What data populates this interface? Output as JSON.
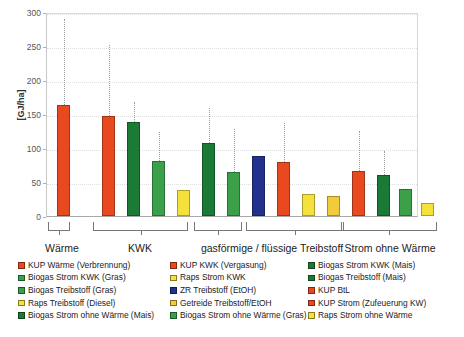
{
  "chart_data": {
    "type": "bar",
    "title": "",
    "xlabel": "",
    "ylabel": "[GJ/ha]",
    "ylim": [
      0,
      300
    ],
    "yticks": [
      0,
      50,
      100,
      150,
      200,
      250,
      300
    ],
    "grid": true,
    "legend_position": "bottom",
    "error_bars": "dotted upper whisker",
    "groups": [
      {
        "label": "Wärme",
        "n_bars": 1
      },
      {
        "label": "KWK",
        "n_bars": 4
      },
      {
        "label": "gasförmige / flüssige Treibstoff",
        "n_bars": 6,
        "sub_brackets": 2
      },
      {
        "label": "Strom ohne Wärme",
        "n_bars": 4
      }
    ],
    "categories": [
      "KUP Wärme (Verbrennung)",
      "KUP KWK (Vergasung)",
      "Biogas Strom KWK (Mais)",
      "Biogas Strom KWK (Gras)",
      "Raps Strom KWK",
      "Biogas Treibstoff (Mais)",
      "Biogas Treibstoff (Gras)",
      "ZR Treibstoff (EtOH)",
      "KUP BtL",
      "Raps Treibstoff (Diesel)",
      "Getreide Treibstoff/EtOH",
      "KUP Strom (Zufeuerung KW)",
      "Biogas Strom ohne Wärme (Mais)",
      "Biogas Strom ohne Wärme (Gras)",
      "Raps Strom ohne Wärme"
    ],
    "values": [
      163,
      147,
      138,
      81,
      38,
      108,
      64,
      88,
      79,
      33,
      30,
      66,
      61,
      39,
      19
    ],
    "error_upper": [
      290,
      251,
      167,
      123,
      null,
      159,
      128,
      null,
      137,
      null,
      null,
      125,
      96,
      null,
      null
    ],
    "colors": [
      "#e8491f",
      "#e8491f",
      "#1b7a36",
      "#3aa14a",
      "#f5e13c",
      "#1b7a36",
      "#3aa14a",
      "#22328c",
      "#e8491f",
      "#f5e13c",
      "#f2cb3a",
      "#e8491f",
      "#1b7a36",
      "#3aa14a",
      "#f5e13c"
    ],
    "bars": [
      {
        "name": "KUP Wärme (Verbrennung)",
        "value": 163,
        "upper": 290,
        "color": "#e8491f",
        "group": "Wärme",
        "x": 56
      },
      {
        "name": "KUP KWK (Vergasung)",
        "value": 147,
        "upper": 251,
        "color": "#e8491f",
        "group": "KWK",
        "x": 101
      },
      {
        "name": "Biogas Strom KWK (Mais)",
        "value": 138,
        "upper": 167,
        "color": "#1b7a36",
        "group": "KWK",
        "x": 126
      },
      {
        "name": "Biogas Strom KWK (Gras)",
        "value": 81,
        "upper": 123,
        "color": "#3aa14a",
        "group": "KWK",
        "x": 151
      },
      {
        "name": "Raps Strom KWK",
        "value": 38,
        "upper": null,
        "color": "#f5e13c",
        "group": "KWK",
        "x": 176
      },
      {
        "name": "Biogas Treibstoff (Mais)",
        "value": 108,
        "upper": 159,
        "color": "#1b7a36",
        "group": "gasförmige / flüssige Treibstoff",
        "x": 201
      },
      {
        "name": "Biogas Treibstoff (Gras)",
        "value": 64,
        "upper": 128,
        "color": "#3aa14a",
        "group": "gasförmige / flüssige Treibstoff",
        "x": 226
      },
      {
        "name": "ZR Treibstoff (EtOH)",
        "value": 88,
        "upper": null,
        "color": "#22328c",
        "group": "gasförmige / flüssige Treibstoff",
        "x": 251
      },
      {
        "name": "KUP BtL",
        "value": 79,
        "upper": 137,
        "color": "#e8491f",
        "group": "gasförmige / flüssige Treibstoff",
        "x": 276
      },
      {
        "name": "Raps Treibstoff (Diesel)",
        "value": 33,
        "upper": null,
        "color": "#f5e13c",
        "group": "gasförmige / flüssige Treibstoff",
        "x": 301
      },
      {
        "name": "Getreide Treibstoff/EtOH",
        "value": 30,
        "upper": null,
        "color": "#f2cb3a",
        "group": "gasförmige / flüssige Treibstoff",
        "x": 326
      },
      {
        "name": "KUP Strom (Zufeuerung KW)",
        "value": 66,
        "upper": 125,
        "color": "#e8491f",
        "group": "Strom ohne Wärme",
        "x": 351
      },
      {
        "name": "Biogas Strom ohne Wärme (Mais)",
        "value": 61,
        "upper": 96,
        "color": "#1b7a36",
        "group": "Strom ohne Wärme",
        "x": 376
      },
      {
        "name": "Biogas Strom ohne Wärme (Gras)",
        "value": 39,
        "upper": null,
        "color": "#3aa14a",
        "group": "Strom ohne Wärme",
        "x": 398
      },
      {
        "name": "Raps Strom ohne Wärme",
        "value": 19,
        "upper": null,
        "color": "#f5e13c",
        "group": "Strom ohne Wärme",
        "x": 420
      }
    ]
  },
  "axis": {
    "y_unit_label": "[GJ/ha]",
    "ticks": [
      "300",
      "250",
      "200",
      "150",
      "100",
      "50",
      "0"
    ]
  },
  "group_labels": [
    {
      "text": "Wärme",
      "center": 62,
      "bracket_left": 48,
      "bracket_width": 22
    },
    {
      "text": "KWK",
      "center": 140,
      "bracket_left": 93,
      "bracket_width": 95
    },
    {
      "text": "gasförmige / flüssige Treibstoff",
      "center": 272,
      "bracket_left": 194,
      "bracket_width": 150,
      "sub": [
        {
          "left": 194,
          "width": 48
        },
        {
          "left": 246,
          "width": 98
        }
      ]
    },
    {
      "text": "Strom ohne Wärme",
      "center": 390,
      "bracket_left": 341,
      "bracket_width": 96
    }
  ],
  "legend": {
    "columns": [
      {
        "items": [
          {
            "label": "KUP Wärme (Verbrennung)",
            "color": "#e8491f"
          },
          {
            "label": "Biogas Strom KWK (Gras)",
            "color": "#3aa14a"
          },
          {
            "label": "Biogas Treibstoff (Gras)",
            "color": "#3aa14a"
          },
          {
            "label": "Raps Treibstoff (Diesel)",
            "color": "#f5e13c"
          },
          {
            "label": "Biogas Strom ohne Wärme (Mais)",
            "color": "#1b7a36"
          }
        ]
      },
      {
        "items": [
          {
            "label": "KUP KWK (Vergasung)",
            "color": "#e8491f"
          },
          {
            "label": "Raps Strom KWK",
            "color": "#f5e13c"
          },
          {
            "label": "ZR Treibstoff (EtOH)",
            "color": "#22328c"
          },
          {
            "label": "Getreide Treibstoff/EtOH",
            "color": "#f2cb3a"
          },
          {
            "label": "Biogas Strom ohne Wärme (Gras)",
            "color": "#3aa14a"
          }
        ]
      },
      {
        "items": [
          {
            "label": "Biogas Strom KWK (Mais)",
            "color": "#1b7a36"
          },
          {
            "label": "Biogas Treibstoff (Mais)",
            "color": "#1b7a36"
          },
          {
            "label": "KUP BtL",
            "color": "#e8491f"
          },
          {
            "label": "KUP Strom (Zufeuerung KW)",
            "color": "#e8491f"
          },
          {
            "label": "Raps Strom ohne Wärme",
            "color": "#f5e13c"
          }
        ]
      }
    ]
  }
}
